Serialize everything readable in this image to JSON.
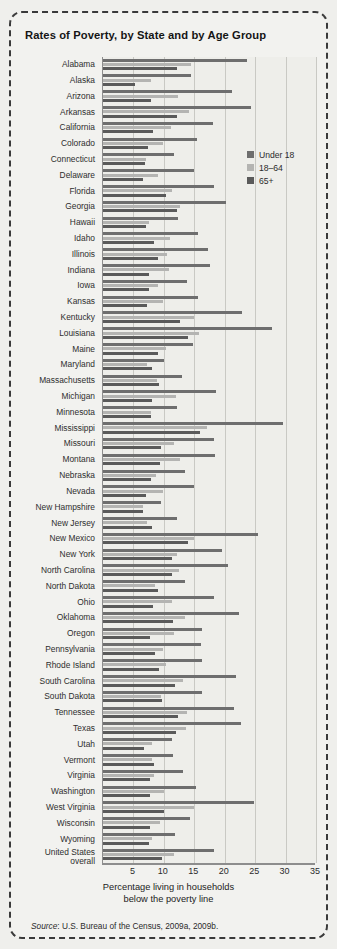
{
  "title": "Rates of Poverty, by State and by Age Group",
  "source_prefix": "Source",
  "source_text": ": U.S. Bureau of the Census, 2009a, 2009b.",
  "xlabel_line1": "Percentage living in households",
  "xlabel_line2": "below the poverty line",
  "legend": {
    "position": "inside-top-right",
    "items": [
      {
        "label": "Under 18",
        "color": "#6e6e6e"
      },
      {
        "label": "18–64",
        "color": "#b4b4b2"
      },
      {
        "label": "65+",
        "color": "#5a5a5a"
      }
    ]
  },
  "ticks": [
    "5",
    "10",
    "15",
    "20",
    "25",
    "30",
    "35"
  ],
  "chart_data": {
    "type": "bar",
    "orientation": "horizontal",
    "grouped": true,
    "title": "Rates of Poverty, by State and by Age Group",
    "xlabel": "Percentage living in households below the poverty line",
    "ylabel": "",
    "xlim": [
      0,
      35
    ],
    "xticks": [
      5,
      10,
      15,
      20,
      25,
      30,
      35
    ],
    "grid": "vertical",
    "legend_position": "inside-top-right",
    "series": [
      {
        "name": "Under 18",
        "color": "#6e6e6e"
      },
      {
        "name": "18–64",
        "color": "#b4b4b2"
      },
      {
        "name": "65+",
        "color": "#5a5a5a"
      }
    ],
    "categories": [
      "Alabama",
      "Alaska",
      "Arizona",
      "Arkansas",
      "California",
      "Colorado",
      "Connecticut",
      "Delaware",
      "Florida",
      "Georgia",
      "Hawaii",
      "Idaho",
      "Illinois",
      "Indiana",
      "Iowa",
      "Kansas",
      "Kentucky",
      "Louisiana",
      "Maine",
      "Maryland",
      "Massachusetts",
      "Michigan",
      "Minnesota",
      "Mississippi",
      "Missouri",
      "Montana",
      "Nebraska",
      "Nevada",
      "New Hampshire",
      "New Jersey",
      "New Mexico",
      "New York",
      "North Carolina",
      "North Dakota",
      "Ohio",
      "Oklahoma",
      "Oregon",
      "Pennsylvania",
      "Rhode Island",
      "South Carolina",
      "South Dakota",
      "Tennessee",
      "Texas",
      "Utah",
      "Vermont",
      "Virginia",
      "Washington",
      "West Virginia",
      "Wisconsin",
      "Wyoming",
      "United States overall"
    ],
    "values": {
      "Under 18": [
        23.7,
        14.5,
        21.2,
        24.3,
        18.1,
        15.5,
        11.6,
        14.9,
        18.2,
        20.2,
        12.3,
        15.6,
        17.2,
        17.5,
        13.8,
        15.6,
        22.8,
        27.8,
        14.8,
        10.1,
        13.0,
        18.5,
        12.1,
        29.5,
        18.3,
        18.4,
        13.5,
        15.0,
        9.6,
        12.1,
        25.4,
        19.5,
        20.5,
        13.4,
        18.2,
        22.3,
        16.2,
        16.1,
        16.3,
        21.8,
        16.3,
        21.6,
        22.7,
        11.3,
        11.5,
        13.2,
        15.2,
        24.8,
        14.3,
        11.8,
        18.2
      ],
      "18–64": [
        14.4,
        7.9,
        12.4,
        14.1,
        11.1,
        9.8,
        7.0,
        9.0,
        11.3,
        12.6,
        7.6,
        11.0,
        10.5,
        10.9,
        9.1,
        9.9,
        14.9,
        15.7,
        10.4,
        7.2,
        8.9,
        12.0,
        7.9,
        17.1,
        11.6,
        12.6,
        8.7,
        9.9,
        6.5,
        7.3,
        15.0,
        12.1,
        12.5,
        8.6,
        11.4,
        13.5,
        11.6,
        9.8,
        10.4,
        13.2,
        9.6,
        13.8,
        13.6,
        8.1,
        8.0,
        8.4,
        10.1,
        14.9,
        9.3,
        8.1,
        11.7
      ],
      "65+": [
        12.2,
        5.3,
        7.9,
        12.1,
        8.2,
        7.4,
        6.9,
        6.6,
        10.4,
        12.1,
        7.0,
        8.4,
        9.0,
        7.5,
        7.5,
        7.3,
        12.6,
        14.0,
        9.1,
        8.0,
        9.2,
        8.1,
        7.9,
        16.0,
        9.5,
        9.4,
        7.9,
        7.1,
        6.6,
        8.0,
        14.0,
        11.4,
        11.3,
        9.1,
        8.2,
        11.5,
        7.7,
        8.5,
        9.2,
        11.9,
        9.7,
        12.3,
        12.0,
        6.8,
        8.4,
        7.8,
        7.7,
        10.1,
        7.8,
        7.6,
        9.7
      ]
    }
  }
}
